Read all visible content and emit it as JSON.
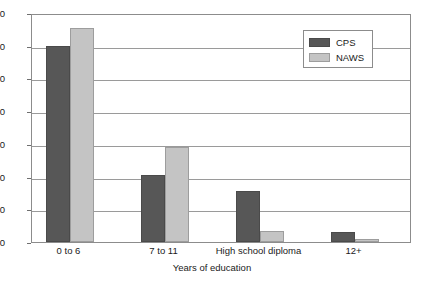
{
  "chart_data": {
    "type": "bar",
    "title": "",
    "subtitle": "",
    "xlabel": "Years of education",
    "ylabel": "",
    "categories": [
      "0 to 6",
      "7 to 11",
      "High school diploma",
      "12+"
    ],
    "series": [
      {
        "name": "CPS",
        "color": "#575757",
        "values": [
          60,
          20.5,
          15.5,
          3
        ]
      },
      {
        "name": "NAWS",
        "color": "#c4c4c4",
        "values": [
          65.5,
          29,
          3.5,
          1
        ]
      }
    ],
    "ylim": [
      0,
      70
    ],
    "yticks": [
      0,
      10,
      20,
      30,
      40,
      50,
      60,
      70
    ],
    "ytick_labels": [
      "0",
      "10",
      "20",
      "30",
      "40",
      "50",
      "60",
      "70"
    ],
    "grid": true,
    "grid_axis": "y",
    "legend_position": "top-right",
    "legend_entries": [
      "CPS",
      "NAWS"
    ]
  }
}
